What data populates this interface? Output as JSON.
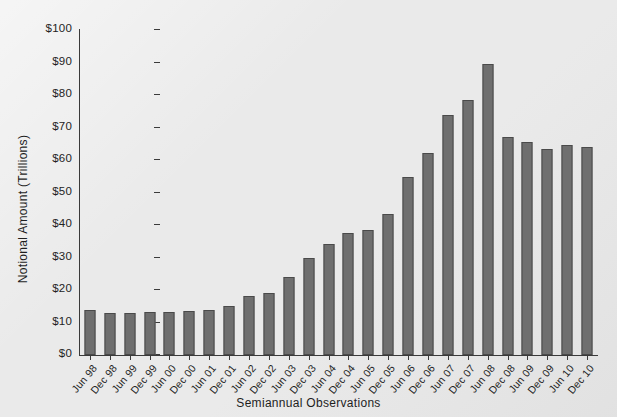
{
  "chart_data": {
    "type": "bar",
    "title": "",
    "xlabel": "Semiannual Observations",
    "ylabel": "Notional Amount (Trillions)",
    "ylim": [
      0,
      100
    ],
    "ytick_labels": [
      "$100",
      "$90",
      "$80",
      "$70",
      "$60",
      "$50",
      "$40",
      "$30",
      "$20",
      "$10",
      "$0"
    ],
    "ytick_values": [
      100,
      90,
      80,
      70,
      60,
      50,
      40,
      30,
      20,
      10,
      0
    ],
    "grid": false,
    "legend": "none",
    "bar_color": "#6f6f6f",
    "bar_edge_color": "#4a4a4a",
    "background_color": "#eaeaea",
    "categories": [
      "Jun 98",
      "Dec 98",
      "Jun 99",
      "Dec 99",
      "Jun 00",
      "Dec 00",
      "Jun 01",
      "Dec 01",
      "Jun 02",
      "Dec 02",
      "Jun 03",
      "Dec 03",
      "Jun 04",
      "Dec 04",
      "Jun 05",
      "Dec 05",
      "Jun 06",
      "Dec 06",
      "Jun 07",
      "Dec 07",
      "Jun 08",
      "Dec 08",
      "Jun 09",
      "Dec 09",
      "Jun 10",
      "Dec 10"
    ],
    "values": [
      13.8,
      13.0,
      13.0,
      13.3,
      13.3,
      13.5,
      13.7,
      15.2,
      18.2,
      19.2,
      24.0,
      29.7,
      34.2,
      37.4,
      38.5,
      43.4,
      54.8,
      62.2,
      73.9,
      78.6,
      89.4,
      67.0,
      65.4,
      63.4,
      64.6,
      64.0
    ]
  }
}
